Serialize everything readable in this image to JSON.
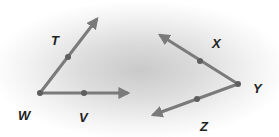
{
  "figure": {
    "angles": [
      {
        "name": "angle-TWV",
        "vertex": "W",
        "rays": [
          {
            "from": "W",
            "through": "T"
          },
          {
            "from": "W",
            "through": "V"
          }
        ]
      },
      {
        "name": "angle-XYZ",
        "vertex": "Y",
        "rays": [
          {
            "from": "Y",
            "through": "X"
          },
          {
            "from": "Y",
            "through": "Z"
          }
        ]
      }
    ],
    "labels": {
      "T": "T",
      "W": "W",
      "V": "V",
      "X": "X",
      "Y": "Y",
      "Z": "Z"
    },
    "colors": {
      "ray": "#7a7a7a",
      "point": "#5e5e5e",
      "label": "#222222"
    }
  }
}
